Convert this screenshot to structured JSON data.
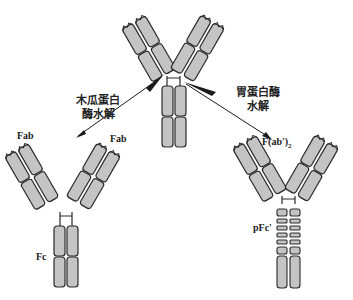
{
  "diagram": {
    "type": "antibody-enzymatic-hydrolysis",
    "colors": {
      "domain_fill": "#c4c4c4",
      "outline": "#2a2a2a",
      "background": "#ffffff",
      "arrow": "#1a1a1a"
    },
    "top_antibody": {
      "label": ""
    },
    "left_branch": {
      "enzyme_label_line1": "木瓜蛋白",
      "enzyme_label_line2": "酶水解",
      "fragments": {
        "fab_left": "Fab",
        "fab_right": "Fab",
        "fc": "Fc"
      }
    },
    "right_branch": {
      "enzyme_label_line1": "胃蛋白酶",
      "enzyme_label_line2": "水解",
      "fragments": {
        "fab2": "F(ab')",
        "fab2_sub": "2",
        "pfc": "pFc'"
      }
    }
  }
}
